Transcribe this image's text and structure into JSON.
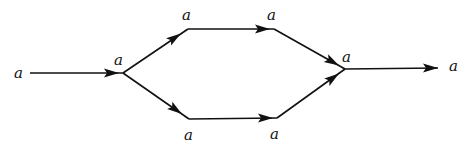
{
  "diagram": {
    "type": "directed-graph",
    "colors": {
      "line": "#111111",
      "background": "#ffffff"
    },
    "nodes": [
      {
        "id": "in",
        "label": "a",
        "x": 30,
        "y": 73
      },
      {
        "id": "s",
        "label": "a",
        "x": 123,
        "y": 73
      },
      {
        "id": "u1",
        "label": "a",
        "x": 188,
        "y": 29
      },
      {
        "id": "u2",
        "label": "a",
        "x": 274,
        "y": 29
      },
      {
        "id": "l1",
        "label": "a",
        "x": 189,
        "y": 119
      },
      {
        "id": "l2",
        "label": "a",
        "x": 277,
        "y": 118
      },
      {
        "id": "m",
        "label": "a",
        "x": 345,
        "y": 69
      },
      {
        "id": "out",
        "label": "a",
        "x": 438,
        "y": 68
      }
    ],
    "labels": {
      "in": "a",
      "split": "a",
      "upper_left": "a",
      "upper_right": "a",
      "lower_left": "a",
      "lower_right": "a",
      "merge": "a",
      "out": "a"
    },
    "edges": [
      {
        "from": "in",
        "to": "s"
      },
      {
        "from": "s",
        "to": "u1"
      },
      {
        "from": "u1",
        "to": "u2"
      },
      {
        "from": "u2",
        "to": "m"
      },
      {
        "from": "s",
        "to": "l1"
      },
      {
        "from": "l1",
        "to": "l2"
      },
      {
        "from": "l2",
        "to": "m"
      },
      {
        "from": "m",
        "to": "out"
      }
    ]
  }
}
